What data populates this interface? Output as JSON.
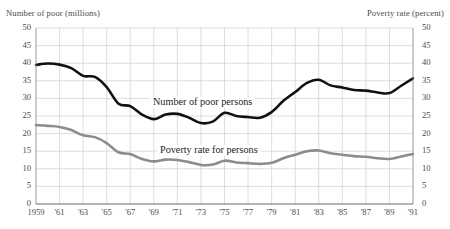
{
  "chart_data": {
    "type": "line",
    "title": "",
    "subtitle": "",
    "xlabel": "",
    "ylabel": "Number of poor (millions)",
    "y2label": "Poverty rate (percent)",
    "grid": true,
    "legend_position": "inline-on-curve",
    "ylim": [
      0,
      50
    ],
    "y2lim": [
      0,
      50
    ],
    "xlim": [
      1959,
      1991
    ],
    "yticks": [
      0,
      5,
      10,
      15,
      20,
      25,
      30,
      35,
      40,
      45,
      50
    ],
    "y2ticks": [
      0,
      5,
      10,
      15,
      20,
      25,
      30,
      35,
      40,
      45,
      50
    ],
    "ytick_labels": [
      "0",
      "5",
      "10",
      "15",
      "20",
      "25",
      "30",
      "35",
      "40",
      "45",
      "50"
    ],
    "y2tick_labels": [
      "0",
      "5",
      "10",
      "15",
      "20",
      "25",
      "30",
      "35",
      "40",
      "45",
      "50"
    ],
    "x": [
      1959,
      1960,
      1961,
      1962,
      1963,
      1964,
      1965,
      1966,
      1967,
      1968,
      1969,
      1970,
      1971,
      1972,
      1973,
      1974,
      1975,
      1976,
      1977,
      1978,
      1979,
      1980,
      1981,
      1982,
      1983,
      1984,
      1985,
      1986,
      1987,
      1988,
      1989,
      1990,
      1991
    ],
    "xticks": [
      1959,
      1961,
      1963,
      1965,
      1967,
      1969,
      1971,
      1973,
      1975,
      1977,
      1979,
      1981,
      1983,
      1985,
      1987,
      1989,
      1991
    ],
    "xtick_labels": [
      "1959",
      "'61",
      "'63",
      "'65",
      "'67",
      "'69",
      "'71",
      "'73",
      "'75",
      "'77",
      "'79",
      "'81",
      "'83",
      "'85",
      "'87",
      "'89",
      "'91"
    ],
    "series": [
      {
        "name": "Number of poor persons",
        "axis": "left",
        "units": "millions",
        "color": "#111111",
        "width": 2.6,
        "label_text": "Number of poor persons",
        "values": [
          39.5,
          39.9,
          39.6,
          38.6,
          36.4,
          36.1,
          33.2,
          28.5,
          27.8,
          25.4,
          24.1,
          25.4,
          25.6,
          24.5,
          23.0,
          23.4,
          25.9,
          25.0,
          24.7,
          24.5,
          26.1,
          29.3,
          31.8,
          34.4,
          35.3,
          33.7,
          33.1,
          32.4,
          32.2,
          31.7,
          31.5,
          33.6,
          35.7
        ]
      },
      {
        "name": "Poverty rate for persons",
        "axis": "right",
        "units": "percent",
        "color": "#8c8c8c",
        "width": 2.6,
        "label_text": "Poverty rate for persons",
        "values": [
          22.4,
          22.2,
          21.9,
          21.0,
          19.5,
          19.0,
          17.3,
          14.7,
          14.2,
          12.8,
          12.1,
          12.6,
          12.5,
          11.9,
          11.1,
          11.2,
          12.3,
          11.8,
          11.6,
          11.4,
          11.7,
          13.0,
          14.0,
          15.0,
          15.2,
          14.4,
          14.0,
          13.6,
          13.4,
          13.0,
          12.8,
          13.5,
          14.2
        ]
      }
    ]
  },
  "captions": {
    "left": "Number of poor (millions)",
    "right": "Poverty rate (percent)"
  }
}
